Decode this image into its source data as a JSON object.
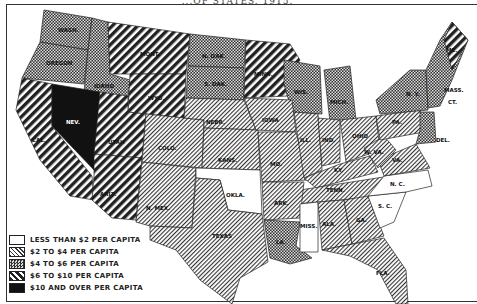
{
  "title": "...OF STATES. 1915.",
  "legend": {
    "items": [
      {
        "key": "lt2",
        "label": "LESS THAN $2 PER CAPITA",
        "pattern": "none"
      },
      {
        "key": "2to4",
        "label": "$2  TO $4  PER CAPITA",
        "pattern": "fine-hatch"
      },
      {
        "key": "4to6",
        "label": "$4  TO  $6  PER CAPITA",
        "pattern": "checker"
      },
      {
        "key": "6to10",
        "label": "$6  TO $10 PER CAPITA",
        "pattern": "bold-hatch"
      },
      {
        "key": "10plus",
        "label": "$10 AND OVER PER CAPITA",
        "pattern": "solid"
      }
    ]
  },
  "states": [
    {
      "abbr": "WASH.",
      "category": "4to6"
    },
    {
      "abbr": "OREGON",
      "category": "4to6"
    },
    {
      "abbr": "IDAHO",
      "category": "4to6"
    },
    {
      "abbr": "MONT.",
      "category": "6to10"
    },
    {
      "abbr": "WYO.",
      "category": "6to10"
    },
    {
      "abbr": "CAL.",
      "category": "6to10"
    },
    {
      "abbr": "NEV.",
      "category": "10plus"
    },
    {
      "abbr": "UTAH",
      "category": "6to10"
    },
    {
      "abbr": "ARIZ.",
      "category": "6to10"
    },
    {
      "abbr": "COLO.",
      "category": "2to4"
    },
    {
      "abbr": "N. MEX.",
      "category": "2to4"
    },
    {
      "abbr": "N. DAK.",
      "category": "4to6"
    },
    {
      "abbr": "S. DAK.",
      "category": "4to6"
    },
    {
      "abbr": "NEBR.",
      "category": "2to4"
    },
    {
      "abbr": "KANS.",
      "category": "2to4"
    },
    {
      "abbr": "OKLA.",
      "category": "lt2"
    },
    {
      "abbr": "TEXAS",
      "category": "2to4"
    },
    {
      "abbr": "MINN.",
      "category": "6to10"
    },
    {
      "abbr": "IOWA",
      "category": "2to4"
    },
    {
      "abbr": "MO.",
      "category": "2to4"
    },
    {
      "abbr": "ARK.",
      "category": "2to4"
    },
    {
      "abbr": "LA.",
      "category": "4to6"
    },
    {
      "abbr": "WIS.",
      "category": "4to6"
    },
    {
      "abbr": "MICH.",
      "category": "4to6"
    },
    {
      "abbr": "ILL.",
      "category": "2to4"
    },
    {
      "abbr": "IND.",
      "category": "2to4"
    },
    {
      "abbr": "OHIO",
      "category": "2to4"
    },
    {
      "abbr": "KY.",
      "category": "2to4"
    },
    {
      "abbr": "TENN.",
      "category": "2to4"
    },
    {
      "abbr": "MISS.",
      "category": "lt2"
    },
    {
      "abbr": "ALA.",
      "category": "2to4"
    },
    {
      "abbr": "GA.",
      "category": "2to4"
    },
    {
      "abbr": "FLA.",
      "category": "2to4"
    },
    {
      "abbr": "N. C.",
      "category": "lt2"
    },
    {
      "abbr": "S. C.",
      "category": "lt2"
    },
    {
      "abbr": "W. VA.",
      "category": "2to4"
    },
    {
      "abbr": "VA.",
      "category": "2to4"
    },
    {
      "abbr": "PA.",
      "category": "2to4"
    },
    {
      "abbr": "N. Y.",
      "category": "4to6"
    },
    {
      "abbr": "VT.",
      "category": "4to6"
    },
    {
      "abbr": "N. H.",
      "category": "4to6"
    },
    {
      "abbr": "ME.",
      "category": "6to10"
    },
    {
      "abbr": "MASS.",
      "category": "4to6"
    },
    {
      "abbr": "CT.",
      "category": "4to6"
    },
    {
      "abbr": "DEL.",
      "category": "4to6"
    },
    {
      "abbr": "MD.",
      "category": "4to6"
    },
    {
      "abbr": "N. J.",
      "category": "4to6"
    }
  ],
  "labels": {
    "wash": "WASH.",
    "oregon": "OREGON",
    "idaho": "IDAHO",
    "mont": "MONT.",
    "wyo": "WYO.",
    "cal": "CAL.",
    "nev": "NEV.",
    "utah": "UTAH",
    "ariz": "ARIZ.",
    "colo": "COLO.",
    "nmex": "N. MEX.",
    "ndak": "N. DAK.",
    "sdak": "S. DAK.",
    "nebr": "NEBR.",
    "kans": "KANS.",
    "okla": "OKLA.",
    "texas": "TEXAS",
    "minn": "MINN.",
    "iowa": "IOWA",
    "mo": "MO.",
    "ark": "ARK.",
    "la": "LA.",
    "wis": "WIS.",
    "mich": "MICH.",
    "ill": "ILL.",
    "ind": "IND.",
    "ohio": "OHIO",
    "ky": "KY.",
    "tenn": "TENN.",
    "miss": "MISS.",
    "ala": "ALA.",
    "ga": "GA.",
    "fla": "FLA.",
    "nc": "N. C.",
    "sc": "S. C.",
    "wva": "W. VA.",
    "va": "VA.",
    "pa": "PA.",
    "ny": "N. Y.",
    "me": "ME.",
    "mass": "MASS.",
    "ct": "CT.",
    "del": "DEL."
  }
}
